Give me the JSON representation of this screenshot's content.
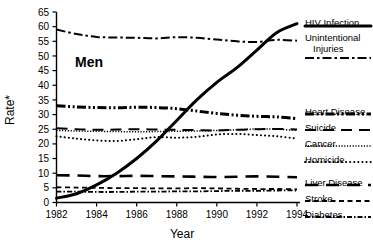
{
  "chart_data": {
    "type": "line",
    "title": "",
    "panel_label": "Men",
    "xlabel": "Year",
    "ylabel": "Rate*",
    "x": [
      1982,
      1983,
      1984,
      1985,
      1986,
      1987,
      1988,
      1989,
      1990,
      1991,
      1992,
      1993,
      1994
    ],
    "xlim": [
      1982,
      1994
    ],
    "ylim": [
      0,
      65
    ],
    "xticks": [
      1982,
      1984,
      1986,
      1988,
      1990,
      1992,
      1994
    ],
    "xtick_labels": [
      "1982",
      "1984",
      "1986",
      "1988",
      "1990",
      "1992",
      "1994"
    ],
    "yticks": [
      0,
      5,
      10,
      15,
      20,
      25,
      30,
      35,
      40,
      45,
      50,
      55,
      60,
      65
    ],
    "ytick_labels": [
      "0",
      "5",
      "10",
      "15",
      "20",
      "25",
      "30",
      "35",
      "40",
      "45",
      "50",
      "55",
      "60",
      "65"
    ],
    "grid": false,
    "legend_position": "right",
    "series": [
      {
        "name": "HIV Infection",
        "style": "solid-thick",
        "values": [
          1.5,
          3,
          6,
          10,
          15,
          21,
          28,
          35,
          41,
          46,
          52,
          58,
          61
        ]
      },
      {
        "name": "Unintentional Injuries",
        "style": "dash-dot",
        "values": [
          59,
          57.5,
          56.5,
          56.3,
          56.2,
          56.0,
          56.4,
          56.2,
          55.6,
          55.0,
          54.8,
          55.5,
          55.2
        ]
      },
      {
        "name": "Heart Disease",
        "style": "dash-dot-dot-thick",
        "values": [
          33,
          32.6,
          32.4,
          32.3,
          32.5,
          32.4,
          32.0,
          31.2,
          30.4,
          29.8,
          29.4,
          29.2,
          28.6
        ]
      },
      {
        "name": "Suicide",
        "style": "long-dash",
        "values": [
          25.3,
          25.0,
          24.8,
          24.9,
          25.0,
          24.9,
          24.8,
          24.7,
          24.6,
          24.8,
          25.0,
          25.1,
          24.9
        ]
      },
      {
        "name": "Cancer",
        "style": "fine-dotted",
        "values": [
          24.6,
          24.4,
          24.3,
          24.2,
          24.1,
          24.2,
          24.3,
          24.4,
          24.6,
          24.8,
          25.1,
          25.0,
          24.6
        ]
      },
      {
        "name": "Homicide",
        "style": "round-dotted",
        "values": [
          22.6,
          21.8,
          21.2,
          21.0,
          21.6,
          22.3,
          22.1,
          22.4,
          23.2,
          23.4,
          23.0,
          22.6,
          21.8
        ]
      },
      {
        "name": "Liver Disease",
        "style": "dash-wide-thick",
        "values": [
          9.3,
          9.2,
          9.0,
          9.0,
          9.1,
          9.0,
          8.9,
          8.8,
          8.7,
          8.8,
          8.9,
          8.8,
          8.6
        ]
      },
      {
        "name": "Stroke",
        "style": "dashed",
        "values": [
          5.2,
          5.1,
          5.0,
          4.9,
          4.9,
          4.8,
          4.8,
          4.9,
          4.8,
          4.7,
          4.6,
          4.6,
          4.5
        ]
      },
      {
        "name": "Diabetes",
        "style": "dash-dot-small",
        "values": [
          3.7,
          3.7,
          3.6,
          3.6,
          3.7,
          3.7,
          3.8,
          3.8,
          3.9,
          4.0,
          4.0,
          4.1,
          4.1
        ]
      }
    ],
    "legend": [
      {
        "label": "HIV Infection",
        "style": "solid-thick"
      },
      {
        "label": "Unintentional\nInjuries",
        "style": "dash-dot"
      },
      {
        "label": "Heart Disease",
        "style": "dash-dot-dot-thick"
      },
      {
        "label": "Suicide",
        "style": "long-dash"
      },
      {
        "label": "Cancer",
        "style": "fine-dotted"
      },
      {
        "label": "Homicide",
        "style": "round-dotted"
      },
      {
        "label": "Liver Disease",
        "style": "dash-wide-thick"
      },
      {
        "label": "Stroke",
        "style": "dashed"
      },
      {
        "label": "Diabetes",
        "style": "dash-dot-small"
      }
    ],
    "colors": {
      "line": "#000000",
      "axis": "#000000",
      "background": "#ffffff"
    }
  },
  "legend_text": {
    "hiv": "HIV Infection",
    "unintentional_1": "Unintentional",
    "unintentional_2": "Injuries",
    "heart": "Heart Disease",
    "suicide": "Suicide",
    "cancer": "Cancer",
    "homicide": "Homicide",
    "liver": "Liver Disease",
    "stroke": "Stroke",
    "diabetes": "Diabetes"
  },
  "axes": {
    "ylabel": "Rate*",
    "xlabel": "Year",
    "panel_label": "Men"
  }
}
